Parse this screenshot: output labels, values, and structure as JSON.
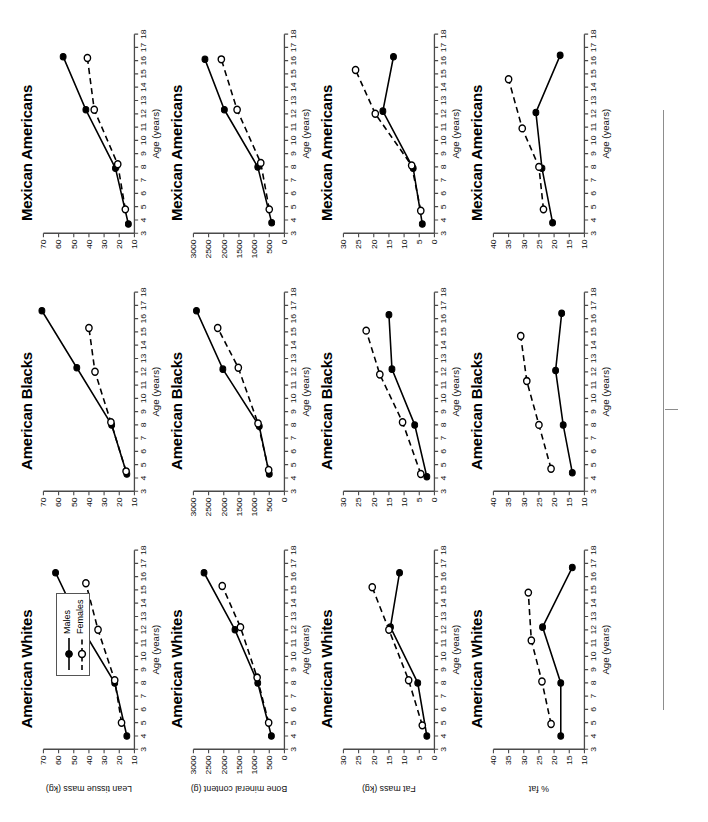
{
  "figure": {
    "legend": {
      "males_label": "Males",
      "females_label": "Females"
    },
    "x_axis": {
      "label": "Age (years)",
      "ticks": [
        "3",
        "4",
        "5",
        "6",
        "7",
        "8",
        "9",
        "10",
        "11",
        "12",
        "13",
        "14",
        "15",
        "16",
        "17",
        "18"
      ],
      "min": 3,
      "max": 18
    },
    "columns": [
      "American Whites",
      "American Blacks",
      "Mexican Americans"
    ],
    "rows": [
      {
        "ylabel": "Lean tissue mass (kg)",
        "ticks": [
          "10",
          "20",
          "30",
          "40",
          "50",
          "60",
          "70"
        ],
        "min": 10,
        "max": 70
      },
      {
        "ylabel": "Bone mineral content (g)",
        "ticks": [
          "0",
          "500",
          "1000",
          "1500",
          "2000",
          "2500",
          "3000"
        ],
        "min": 0,
        "max": 3000
      },
      {
        "ylabel": "Fat mass (kg)",
        "ticks": [
          "0",
          "5",
          "10",
          "15",
          "20",
          "25",
          "30"
        ],
        "min": 0,
        "max": 30
      },
      {
        "ylabel": "% fat",
        "ticks": [
          "10",
          "15",
          "20",
          "25",
          "30",
          "35",
          "40"
        ],
        "min": 10,
        "max": 40
      }
    ]
  },
  "chart_data": [
    {
      "type": "line",
      "title": "American Whites",
      "xlabel": "Age (years)",
      "ylabel": "Lean tissue mass (kg)",
      "xlim": [
        3,
        18
      ],
      "ylim": [
        10,
        70
      ],
      "grid": false,
      "legend": "top-right",
      "series": [
        {
          "name": "Males",
          "x": [
            4.0,
            8.0,
            12.0,
            16.3
          ],
          "values": [
            15.0,
            23.0,
            44.0,
            62.0
          ]
        },
        {
          "name": "Females",
          "x": [
            5.0,
            8.2,
            12.0,
            15.5
          ],
          "values": [
            18.5,
            23.0,
            34.0,
            42.0
          ]
        }
      ]
    },
    {
      "type": "line",
      "title": "American Blacks",
      "xlabel": "Age (years)",
      "ylabel": "Lean tissue mass (kg)",
      "xlim": [
        3,
        18
      ],
      "ylim": [
        10,
        70
      ],
      "grid": false,
      "legend": "none",
      "series": [
        {
          "name": "Males",
          "x": [
            4.3,
            8.0,
            12.3,
            16.6
          ],
          "values": [
            15.0,
            25.0,
            48.0,
            71.0
          ]
        },
        {
          "name": "Females",
          "x": [
            4.5,
            8.2,
            12.0,
            15.3
          ],
          "values": [
            15.5,
            25.5,
            36.0,
            40.0
          ]
        }
      ]
    },
    {
      "type": "line",
      "title": "Mexican Americans",
      "xlabel": "Age (years)",
      "ylabel": "Lean tissue mass (kg)",
      "xlim": [
        3,
        18
      ],
      "ylim": [
        10,
        70
      ],
      "grid": false,
      "legend": "none",
      "series": [
        {
          "name": "Males",
          "x": [
            3.7,
            7.9,
            12.3,
            16.3
          ],
          "values": [
            14.0,
            22.5,
            42.0,
            57.0
          ]
        },
        {
          "name": "Females",
          "x": [
            4.8,
            8.2,
            12.3,
            16.2
          ],
          "values": [
            16.0,
            21.0,
            36.5,
            41.0
          ]
        }
      ]
    },
    {
      "type": "line",
      "title": "American Whites",
      "xlabel": "Age (years)",
      "ylabel": "Bone mineral content (g)",
      "xlim": [
        3,
        18
      ],
      "ylim": [
        0,
        3000
      ],
      "grid": false,
      "legend": "none",
      "series": [
        {
          "name": "Males",
          "x": [
            4.0,
            8.0,
            12.0,
            16.3
          ],
          "values": [
            430,
            880,
            1630,
            2650
          ]
        },
        {
          "name": "Females",
          "x": [
            5.0,
            8.4,
            12.2,
            15.3
          ],
          "values": [
            520,
            900,
            1450,
            2050
          ]
        }
      ]
    },
    {
      "type": "line",
      "title": "American Blacks",
      "xlabel": "Age (years)",
      "ylabel": "Bone mineral content (g)",
      "xlim": [
        3,
        18
      ],
      "ylim": [
        0,
        3000
      ],
      "grid": false,
      "legend": "none",
      "series": [
        {
          "name": "Males",
          "x": [
            4.3,
            7.9,
            12.2,
            16.6
          ],
          "values": [
            500,
            830,
            2030,
            2900
          ]
        },
        {
          "name": "Females",
          "x": [
            4.6,
            8.1,
            12.3,
            15.3
          ],
          "values": [
            520,
            870,
            1520,
            2200
          ]
        }
      ]
    },
    {
      "type": "line",
      "title": "Mexican Americans",
      "xlabel": "Age (years)",
      "ylabel": "Bone mineral content (g)",
      "xlim": [
        3,
        18
      ],
      "ylim": [
        0,
        3000
      ],
      "grid": false,
      "legend": "none",
      "series": [
        {
          "name": "Males",
          "x": [
            3.8,
            8.0,
            12.3,
            16.1
          ],
          "values": [
            420,
            880,
            1980,
            2620
          ]
        },
        {
          "name": "Females",
          "x": [
            4.8,
            8.3,
            12.3,
            16.1
          ],
          "values": [
            500,
            780,
            1560,
            2080
          ]
        }
      ]
    },
    {
      "type": "line",
      "title": "American Whites",
      "xlabel": "Age (years)",
      "ylabel": "Fat mass (kg)",
      "xlim": [
        3,
        18
      ],
      "ylim": [
        0,
        30
      ],
      "grid": false,
      "legend": "none",
      "series": [
        {
          "name": "Males",
          "x": [
            4.0,
            8.0,
            12.2,
            16.3
          ],
          "values": [
            2.5,
            5.5,
            14.5,
            11.5
          ]
        },
        {
          "name": "Females",
          "x": [
            4.8,
            8.2,
            12.0,
            15.2
          ],
          "values": [
            4.0,
            8.5,
            15.0,
            20.5
          ]
        }
      ]
    },
    {
      "type": "line",
      "title": "American Blacks",
      "xlabel": "Age (years)",
      "ylabel": "Fat mass (kg)",
      "xlim": [
        3,
        18
      ],
      "ylim": [
        0,
        30
      ],
      "grid": false,
      "legend": "none",
      "series": [
        {
          "name": "Males",
          "x": [
            4.1,
            8.0,
            12.2,
            16.3
          ],
          "values": [
            2.5,
            6.5,
            14.0,
            15.0
          ]
        },
        {
          "name": "Females",
          "x": [
            4.3,
            8.2,
            11.8,
            15.1
          ],
          "values": [
            4.5,
            10.5,
            18.0,
            22.5
          ]
        }
      ]
    },
    {
      "type": "line",
      "title": "Mexican Americans",
      "xlabel": "Age (years)",
      "ylabel": "Fat mass (kg)",
      "xlim": [
        3,
        18
      ],
      "ylim": [
        0,
        30
      ],
      "grid": false,
      "legend": "none",
      "series": [
        {
          "name": "Males",
          "x": [
            3.7,
            7.9,
            12.2,
            16.3
          ],
          "values": [
            4.0,
            7.0,
            17.0,
            13.5
          ]
        },
        {
          "name": "Females",
          "x": [
            4.7,
            8.1,
            12.0,
            15.3
          ],
          "values": [
            4.5,
            7.5,
            19.5,
            26.0
          ]
        }
      ]
    },
    {
      "type": "line",
      "title": "American Whites",
      "xlabel": "Age (years)",
      "ylabel": "% fat",
      "xlim": [
        3,
        18
      ],
      "ylim": [
        10,
        40
      ],
      "grid": false,
      "legend": "none",
      "series": [
        {
          "name": "Males",
          "x": [
            4.0,
            8.0,
            12.2,
            16.7
          ],
          "values": [
            17.8,
            17.8,
            23.8,
            14.0
          ]
        },
        {
          "name": "Females",
          "x": [
            4.9,
            8.1,
            11.2,
            14.8
          ],
          "values": [
            21.0,
            24.0,
            27.5,
            28.5
          ]
        }
      ]
    },
    {
      "type": "line",
      "title": "American Blacks",
      "xlabel": "Age (years)",
      "ylabel": "% fat",
      "xlim": [
        3,
        18
      ],
      "ylim": [
        10,
        40
      ],
      "grid": false,
      "legend": "none",
      "series": [
        {
          "name": "Males",
          "x": [
            4.4,
            8.0,
            12.1,
            16.4
          ],
          "values": [
            14.0,
            17.0,
            19.5,
            17.5
          ]
        },
        {
          "name": "Females",
          "x": [
            4.7,
            8.0,
            11.3,
            14.7
          ],
          "values": [
            21.0,
            25.0,
            29.0,
            31.0
          ]
        }
      ]
    },
    {
      "type": "line",
      "title": "Mexican Americans",
      "xlabel": "Age (years)",
      "ylabel": "% fat",
      "xlim": [
        3,
        18
      ],
      "ylim": [
        10,
        40
      ],
      "grid": false,
      "legend": "none",
      "series": [
        {
          "name": "Males",
          "x": [
            3.8,
            7.9,
            12.1,
            16.4
          ],
          "values": [
            20.5,
            24.0,
            26.0,
            18.0
          ]
        },
        {
          "name": "Females",
          "x": [
            4.8,
            8.0,
            10.9,
            14.6
          ],
          "values": [
            23.5,
            25.0,
            30.5,
            35.0
          ]
        }
      ]
    }
  ]
}
